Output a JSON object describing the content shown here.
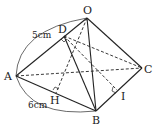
{
  "figure": {
    "type": "pyramid",
    "vertices": {
      "O": "O",
      "A": "A",
      "B": "B",
      "C": "C",
      "D": "D",
      "H": "H",
      "I": "I"
    },
    "dimensions": {
      "OA": "5cm",
      "AB": "6cm"
    },
    "solid_edges": [
      "OA",
      "OB",
      "OC",
      "AB",
      "BC",
      "DB"
    ],
    "hidden_edges": [
      "AC",
      "OH",
      "DC",
      "DI"
    ],
    "right_angles": [
      "D",
      "H",
      "I"
    ]
  }
}
